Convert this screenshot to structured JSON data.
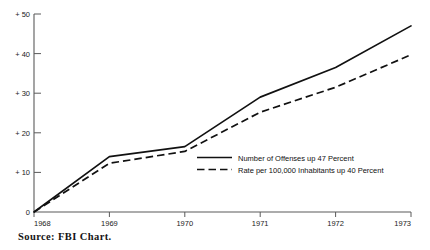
{
  "figure": {
    "source_note": "Source:  FBI  Chart.",
    "clipped_title_fragment": "."
  },
  "chart_data": {
    "type": "line",
    "title": "",
    "xlabel": "",
    "ylabel": "",
    "x": [
      "1968",
      "1969",
      "1970",
      "1971",
      "1972",
      "1973"
    ],
    "categories": [
      "1968",
      "1969",
      "1970",
      "1971",
      "1972",
      "1973"
    ],
    "xtick_labels": [
      "1968",
      "1969",
      "1970",
      "1971",
      "1972",
      "1973"
    ],
    "ytick_labels": [
      "0",
      "+ 10",
      "+ 20",
      "+ 30",
      "+ 40",
      "+ 50"
    ],
    "ytick_values": [
      0,
      10,
      20,
      30,
      40,
      50
    ],
    "ylim": [
      0,
      50
    ],
    "grid": false,
    "legend_position": "inside-center-right",
    "series": [
      {
        "name": "Number of Offenses up 47 Percent",
        "style": "solid",
        "color": "#111111",
        "values": [
          0,
          14.0,
          16.5,
          29.0,
          36.5,
          47.0
        ]
      },
      {
        "name": "Rate per 100,000 Inhabitants up 40 Percent",
        "style": "dashed",
        "color": "#111111",
        "values": [
          0,
          12.3,
          15.3,
          25.2,
          31.5,
          39.7
        ]
      }
    ]
  },
  "axes": {
    "y_ticks": [
      {
        "label": "+ 50",
        "value": 50
      },
      {
        "label": "+ 40",
        "value": 40
      },
      {
        "label": "+ 30",
        "value": 30
      },
      {
        "label": "+ 20",
        "value": 20
      },
      {
        "label": "+ 10",
        "value": 10
      },
      {
        "label": "0",
        "value": 0
      }
    ],
    "x_ticks": [
      {
        "label": "1968",
        "value": 1968
      },
      {
        "label": "1969",
        "value": 1969
      },
      {
        "label": "1970",
        "value": 1970
      },
      {
        "label": "1971",
        "value": 1971
      },
      {
        "label": "1972",
        "value": 1972
      },
      {
        "label": "1973",
        "value": 1973
      }
    ]
  },
  "legend": {
    "entries": [
      {
        "label": "Number of Offenses up 47 Percent",
        "style": "solid"
      },
      {
        "label": "Rate per 100,000 Inhabitants up 40 Percent",
        "style": "dashed"
      }
    ]
  }
}
